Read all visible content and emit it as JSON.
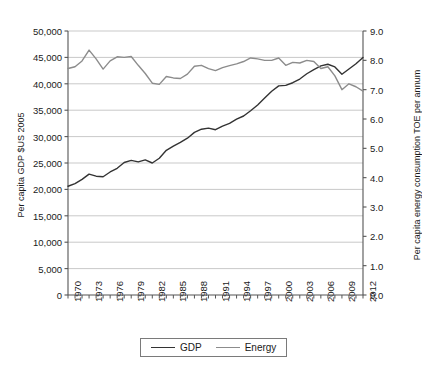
{
  "chart_data": {
    "type": "line",
    "title": "",
    "xlabel": "",
    "ylabel": "Per capita GDP $US 2005",
    "y2label": "Per capita energy consumption TOE per annum",
    "grid": true,
    "legend_position": "bottom",
    "xlim": [
      1970,
      2012
    ],
    "ylim": [
      0,
      50000
    ],
    "y2lim": [
      0.0,
      9.0
    ],
    "ytick_labels": [
      "0",
      "5,000",
      "10,000",
      "15,000",
      "20,000",
      "25,000",
      "30,000",
      "35,000",
      "40,000",
      "45,000",
      "50,000"
    ],
    "ytick_values": [
      0,
      5000,
      10000,
      15000,
      20000,
      25000,
      30000,
      35000,
      40000,
      45000,
      50000
    ],
    "y2tick_labels": [
      "0.0",
      "1.0",
      "2.0",
      "3.0",
      "4.0",
      "5.0",
      "6.0",
      "7.0",
      "8.0",
      "9.0"
    ],
    "y2tick_values": [
      0,
      1,
      2,
      3,
      4,
      5,
      6,
      7,
      8,
      9
    ],
    "x": [
      1970,
      1971,
      1972,
      1973,
      1974,
      1975,
      1976,
      1977,
      1978,
      1979,
      1980,
      1981,
      1982,
      1983,
      1984,
      1985,
      1986,
      1987,
      1988,
      1989,
      1990,
      1991,
      1992,
      1993,
      1994,
      1995,
      1996,
      1997,
      1998,
      1999,
      2000,
      2001,
      2002,
      2003,
      2004,
      2005,
      2006,
      2007,
      2008,
      2009,
      2010,
      2011,
      2012
    ],
    "xtick_labels": [
      "1970",
      "1973",
      "1976",
      "1979",
      "1982",
      "1985",
      "1988",
      "1991",
      "1994",
      "1997",
      "2000",
      "2003",
      "2006",
      "2009",
      "2012"
    ],
    "xtick_values": [
      1970,
      1973,
      1976,
      1979,
      1982,
      1985,
      1988,
      1991,
      1994,
      1997,
      2000,
      2003,
      2006,
      2009,
      2012
    ],
    "series": [
      {
        "name": "GDP",
        "axis": "left",
        "color": "#333333",
        "values": [
          20600,
          21100,
          21900,
          22900,
          22500,
          22400,
          23300,
          24000,
          25100,
          25500,
          25200,
          25600,
          25000,
          25900,
          27400,
          28200,
          28900,
          29700,
          30800,
          31400,
          31600,
          31300,
          32000,
          32500,
          33300,
          33900,
          34900,
          36000,
          37300,
          38600,
          39600,
          39700,
          40200,
          40900,
          41900,
          42700,
          43400,
          43700,
          43200,
          41800,
          42800,
          43800,
          45000
        ]
      },
      {
        "name": "Energy",
        "axis": "right",
        "color": "#8c8c8c",
        "values": [
          7.72,
          7.78,
          7.98,
          8.35,
          8.05,
          7.7,
          7.98,
          8.12,
          8.1,
          8.13,
          7.83,
          7.55,
          7.22,
          7.18,
          7.45,
          7.4,
          7.38,
          7.53,
          7.8,
          7.83,
          7.72,
          7.65,
          7.75,
          7.82,
          7.88,
          7.96,
          8.08,
          8.05,
          8.0,
          8.0,
          8.08,
          7.83,
          7.93,
          7.91,
          8.0,
          7.96,
          7.72,
          7.78,
          7.47,
          7.0,
          7.2,
          7.1,
          6.95
        ]
      }
    ]
  },
  "legend": {
    "items": [
      {
        "label": "GDP",
        "color": "#333333"
      },
      {
        "label": "Energy",
        "color": "#8c8c8c"
      }
    ]
  }
}
